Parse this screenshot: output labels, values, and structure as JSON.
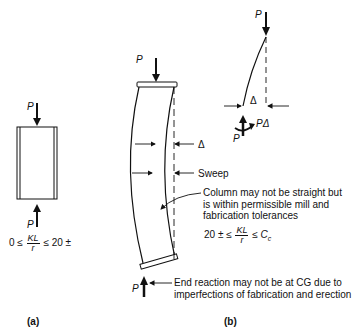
{
  "figure_a": {
    "load_top_label": "P",
    "load_bottom_label": "P",
    "slenderness": {
      "lower": "0 ≤",
      "num": "KL",
      "den": "r",
      "upper": "≤ 20 ±"
    },
    "caption": "(a)"
  },
  "figure_b": {
    "load_top_label": "P",
    "load_bottom_label": "P",
    "delta_label": "Δ",
    "sweep_label": "Sweep",
    "note_column": [
      "Column may not be straight but",
      "is within permissible mill and",
      "fabrication tolerances"
    ],
    "slenderness": {
      "lower": "20 ± ≤",
      "num": "KL",
      "den": "r",
      "upper": "≤ C",
      "upper_sub": "c"
    },
    "note_end_reaction": [
      "End reaction may not be at CG due to",
      "imperfections of fabrication and erection"
    ],
    "caption": "(b)"
  },
  "figure_free_body": {
    "load_top_label": "P",
    "delta_label": "Δ",
    "moment_label": "PΔ",
    "reaction_label": "P"
  }
}
